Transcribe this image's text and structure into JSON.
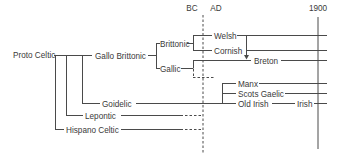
{
  "diagram": {
    "timeline": {
      "bc_label": "BC",
      "ad_label": "AD",
      "year_label": "1900"
    },
    "nodes": {
      "proto_celtic": "Proto Celtic",
      "gallo_brittonic": "Gallo Brittonic",
      "brittonic": "Brittonic",
      "gallic": "Gallic",
      "welsh": "Welsh",
      "cornish": "Cornish",
      "breton": "Breton",
      "goidelic": "Goidelic",
      "manx": "Manx",
      "scots_gaelic": "Scots Gaelic",
      "old_irish": "Old Irish",
      "irish": "Irish",
      "lepontic": "Lepontic",
      "hispano_celtic": "Hispano Celtic"
    },
    "edges": [
      {
        "from": "Proto Celtic",
        "to": "Gallo Brittonic"
      },
      {
        "from": "Proto Celtic",
        "to": "Goidelic"
      },
      {
        "from": "Proto Celtic",
        "to": "Lepontic"
      },
      {
        "from": "Proto Celtic",
        "to": "Hispano Celtic"
      },
      {
        "from": "Gallo Brittonic",
        "to": "Brittonic"
      },
      {
        "from": "Gallo Brittonic",
        "to": "Gallic"
      },
      {
        "from": "Brittonic",
        "to": "Welsh"
      },
      {
        "from": "Brittonic",
        "to": "Cornish"
      },
      {
        "from": "Gallic",
        "to": "Breton"
      },
      {
        "from": "Welsh",
        "to": "Breton",
        "style": "arrow"
      },
      {
        "from": "Goidelic",
        "to": "Manx"
      },
      {
        "from": "Goidelic",
        "to": "Scots Gaelic"
      },
      {
        "from": "Goidelic",
        "to": "Old Irish"
      },
      {
        "from": "Old Irish",
        "to": "Irish"
      }
    ],
    "colors": {
      "line": "#4a4a4a",
      "text": "#3a3a3a",
      "background": "#ffffff"
    }
  }
}
